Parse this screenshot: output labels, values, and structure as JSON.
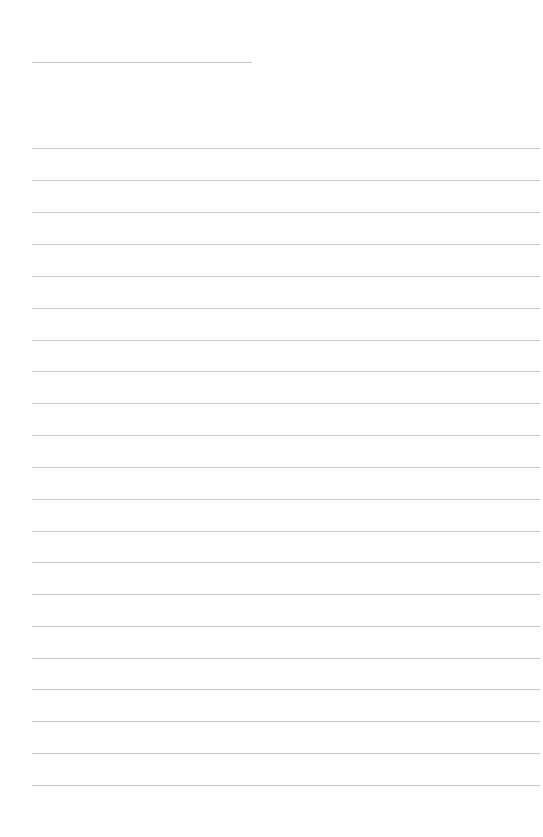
{
  "document": {
    "type": "lined-paper",
    "background_color": "#ffffff",
    "line_color": "#c8c8c8",
    "header_line": {
      "x": 32,
      "y": 62,
      "width": 220
    },
    "lines": {
      "x": 32,
      "width": 508,
      "positions_y": [
        148,
        180,
        212,
        244,
        276,
        308,
        340,
        371,
        403,
        435,
        467,
        499,
        531,
        562,
        594,
        626,
        658,
        689,
        721,
        753,
        785
      ]
    }
  }
}
